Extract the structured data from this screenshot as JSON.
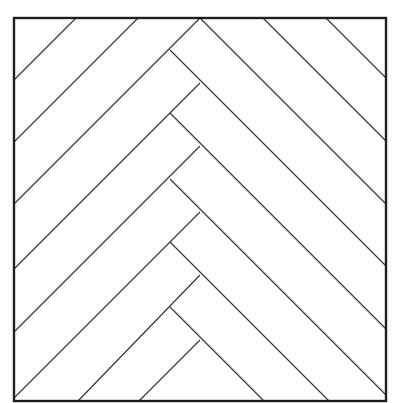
{
  "diagram": {
    "pattern": "herringbone",
    "colors": {
      "background": "#ffffff",
      "frame_stroke": "#1e1e1e",
      "seam_stroke": "#3a3a3a"
    },
    "frame": {
      "x1": 14,
      "y1": 18,
      "x2": 386,
      "y2": 401
    },
    "spine": {
      "outer_x": 200,
      "inner_x": 170,
      "outer_joints_y": [
        18,
        83,
        146,
        212,
        275,
        340
      ],
      "inner_joints_y": [
        50,
        113,
        179,
        242,
        307
      ]
    },
    "seams_down_right": [
      {
        "x1": 326,
        "y1": 18,
        "x2": 386,
        "y2": 78
      },
      {
        "x1": 263,
        "y1": 18,
        "x2": 386,
        "y2": 141
      },
      {
        "x1": 200,
        "y1": 18,
        "x2": 386,
        "y2": 204
      },
      {
        "x1": 170,
        "y1": 50,
        "x2": 386,
        "y2": 266
      },
      {
        "x1": 170,
        "y1": 113,
        "x2": 386,
        "y2": 329
      },
      {
        "x1": 170,
        "y1": 179,
        "x2": 386,
        "y2": 395
      },
      {
        "x1": 170,
        "y1": 242,
        "x2": 329,
        "y2": 401
      },
      {
        "x1": 170,
        "y1": 307,
        "x2": 264,
        "y2": 401
      }
    ],
    "seams_down_left": [
      {
        "x1": 76,
        "y1": 18,
        "x2": 14,
        "y2": 80
      },
      {
        "x1": 138,
        "y1": 18,
        "x2": 14,
        "y2": 142
      },
      {
        "x1": 200,
        "y1": 18,
        "x2": 14,
        "y2": 204
      },
      {
        "x1": 200,
        "y1": 83,
        "x2": 14,
        "y2": 269
      },
      {
        "x1": 200,
        "y1": 146,
        "x2": 14,
        "y2": 332
      },
      {
        "x1": 200,
        "y1": 212,
        "x2": 14,
        "y2": 398
      },
      {
        "x1": 200,
        "y1": 275,
        "x2": 78,
        "y2": 401
      },
      {
        "x1": 200,
        "y1": 340,
        "x2": 139,
        "y2": 401
      }
    ]
  }
}
